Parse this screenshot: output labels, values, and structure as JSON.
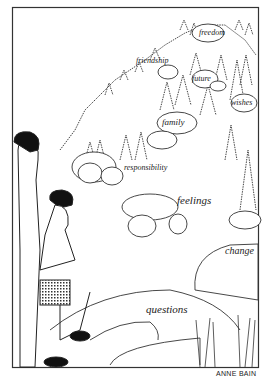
{
  "illustration": {
    "labels": {
      "freedom": "freedom",
      "friendship": "friendship",
      "future": "future",
      "wishes": "wishes",
      "family": "family",
      "responsibility": "responsibility",
      "feelings": "feelings",
      "change": "change",
      "questions": "questions"
    },
    "credit": "ANNE BAIN"
  }
}
